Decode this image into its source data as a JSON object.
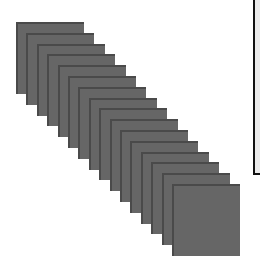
{
  "colors": {
    "background": "#ffffff",
    "card_fill": "#666666",
    "card_edge": "#4a4a4a",
    "panel_fill": "#ebebeb",
    "panel_border": "#111111"
  },
  "stack": {
    "count": 16,
    "first_card": {
      "x": 16,
      "y": 22
    },
    "step": {
      "dx": 10.4,
      "dy": 10.8
    },
    "card_size": {
      "width": 68,
      "height": 72
    }
  },
  "panel": {
    "left": 253,
    "bottom_edge_y": 175
  }
}
